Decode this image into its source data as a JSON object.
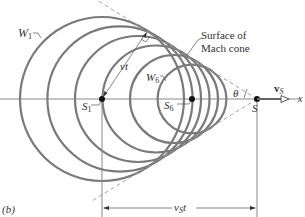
{
  "figure": {
    "panel_label": "(b)"
  },
  "labels": {
    "w1": "W",
    "w1_sub": "1",
    "w6": "W",
    "w6_sub": "6",
    "s1": "S",
    "s1_sub": "1",
    "s6": "S",
    "s6_sub": "6",
    "s": "S",
    "vt": "vt",
    "theta": "θ",
    "vs": "v",
    "vs_sub": "S",
    "x_axis": "x",
    "vst": "v",
    "vst_sub": "S",
    "vst_t": "t",
    "mach_line1": "Surface of",
    "mach_line2": "Mach cone"
  },
  "geometry": {
    "axis_y": 99,
    "source_x": 257,
    "sin_theta": 0.53,
    "wavefront_centers_x": [
      102,
      120,
      138,
      156,
      174,
      192
    ],
    "colors": {
      "wavefront": "#7a7a7a",
      "axis": "#888888",
      "cone": "#9a9a9a",
      "text": "#333333",
      "point": "#111111"
    }
  }
}
